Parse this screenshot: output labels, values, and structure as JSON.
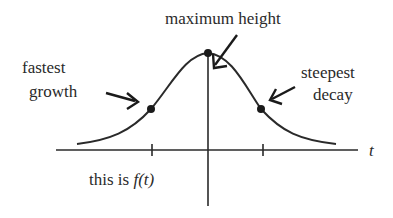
{
  "diagram": {
    "type": "bell-curve",
    "function_label_prefix": "this is ",
    "function_label_func": "f(t)",
    "axis_label_x": "t",
    "annotations": [
      {
        "id": "left",
        "line1": "fastest",
        "line2": "growth"
      },
      {
        "id": "top",
        "line1": "maximum height"
      },
      {
        "id": "right",
        "line1": "steepest",
        "line2": "decay"
      }
    ],
    "points": [
      {
        "name": "inflection-left",
        "x": 151,
        "y": 109
      },
      {
        "name": "maximum",
        "x": 208,
        "y": 53
      },
      {
        "name": "inflection-right",
        "x": 261,
        "y": 109
      }
    ],
    "colors": {
      "ink": "#2a2a2a",
      "background": "#ffffff"
    }
  }
}
